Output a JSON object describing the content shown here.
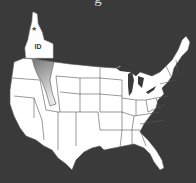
{
  "map": {
    "title": "United States",
    "caption_partial": "g",
    "highlighted_state": {
      "name": "Idaho",
      "abbreviation": "ID",
      "capital_marker": "star-icon"
    },
    "colors": {
      "background": "#3a3a3a",
      "land": "#ffffff",
      "borders": "#555555",
      "highlight_shadow": "#8a8a8a"
    }
  }
}
